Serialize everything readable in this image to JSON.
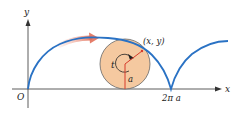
{
  "diagram": {
    "type": "cycloid",
    "axes": {
      "x_label": "x",
      "y_label": "y",
      "origin_label": "O"
    },
    "tick_labels": {
      "cusp": "2π a"
    },
    "circle": {
      "angle_label": "t",
      "radius_label": "a",
      "point_label": "(x, y)",
      "fill": "#f5c9a0",
      "stroke": "#555555"
    },
    "colors": {
      "curve": "#2a72c4",
      "radius": "#d63a2a",
      "motion_arrow": "#e8826a",
      "axes": "#333333"
    }
  }
}
